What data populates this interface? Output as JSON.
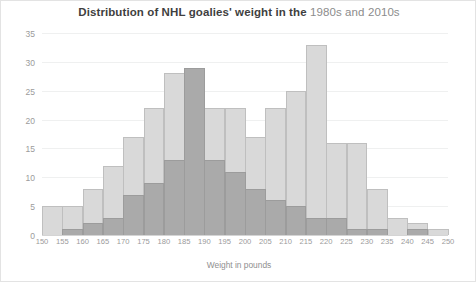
{
  "chart_data": {
    "type": "bar",
    "title_prefix": "Distribution of NHL goalies' weight in the ",
    "title_series_1": "1980s",
    "title_conjunction": " and ",
    "title_series_2": "2010s",
    "title": "Distribution of NHL goalies' weight in the 1980s and 2010s",
    "xlabel": "Weight in pounds",
    "ylabel": "",
    "grid": true,
    "legend_position": "none",
    "xlim": [
      150,
      250
    ],
    "ylim": [
      0,
      35
    ],
    "ytick_labels": [
      "0",
      "5",
      "10",
      "15",
      "20",
      "25",
      "30",
      "35"
    ],
    "ytick_values": [
      0,
      5,
      10,
      15,
      20,
      25,
      30,
      35
    ],
    "xtick_labels": [
      "150",
      "155",
      "160",
      "165",
      "170",
      "175",
      "180",
      "185",
      "190",
      "195",
      "200",
      "205",
      "210",
      "215",
      "220",
      "225",
      "230",
      "235",
      "240",
      "245",
      "250"
    ],
    "xtick_values": [
      150,
      155,
      160,
      165,
      170,
      175,
      180,
      185,
      190,
      195,
      200,
      205,
      210,
      215,
      220,
      225,
      230,
      235,
      240,
      245,
      250
    ],
    "bin_width": 5,
    "bin_starts": [
      150,
      155,
      160,
      165,
      170,
      175,
      180,
      185,
      190,
      195,
      200,
      205,
      210,
      215,
      220,
      225,
      230,
      235,
      240,
      245
    ],
    "series": [
      {
        "name": "1980s",
        "color": "#d9d9d9",
        "edge_color": "#bfbfbf",
        "values": [
          5,
          5,
          8,
          12,
          17,
          22,
          28,
          29,
          22,
          22,
          17,
          22,
          25,
          33,
          16,
          16,
          8,
          3,
          2,
          1
        ]
      },
      {
        "name": "2010s",
        "color": "#8c8c8c",
        "edge_color": "#9c9c9c",
        "values": [
          0,
          1,
          2,
          3,
          7,
          9,
          13,
          29,
          13,
          11,
          8,
          6,
          5,
          3,
          3,
          1,
          1,
          0,
          1,
          0
        ]
      }
    ]
  }
}
